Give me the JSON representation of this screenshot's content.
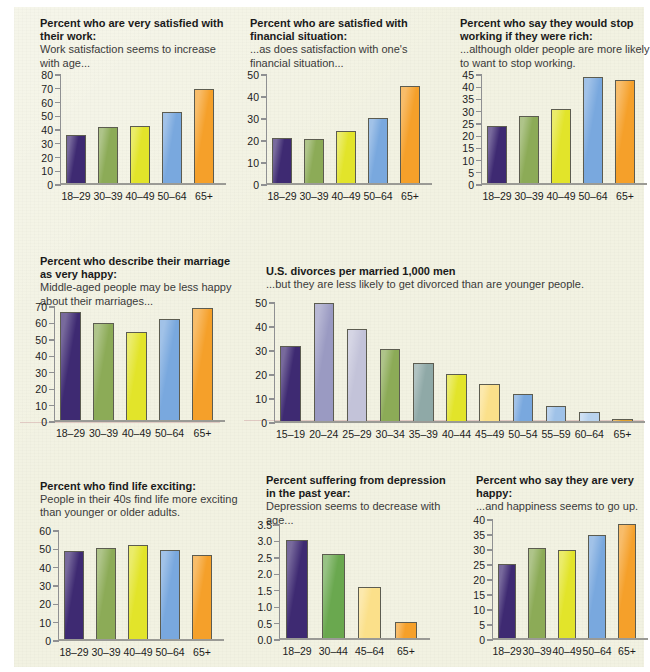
{
  "page": {
    "background_color": "#f2f2e2"
  },
  "palette": {
    "purple": "#3e2a72",
    "olive": "#8cab57",
    "yellow": "#e2e42a",
    "blue": "#79a8de",
    "orange": "#f5a02a",
    "lavender_mid": "#9a9ac2",
    "lavender_light": "#c3c3d9",
    "sage": "#8fa9a7",
    "yellow_pale": "#fbe08a",
    "green": "#6aa84f",
    "gold": "#e0a12e",
    "outline": "#5c5c50",
    "axis": "#8f9092"
  },
  "charts": [
    {
      "id": "satisfied-with-work",
      "chart_data": {
        "type": "bar",
        "title": "Percent who are very satisfied with their work:",
        "subtitle": "Work satisfaction seems to increase with age...",
        "xlabel": "",
        "ylabel": "",
        "categories": [
          "18–29",
          "30–39",
          "40–49",
          "50–64",
          "65+"
        ],
        "values": [
          36,
          41.5,
          42.5,
          53,
          69.5
        ],
        "colors": [
          "#3e2a72",
          "#8cab57",
          "#e2e42a",
          "#79a8de",
          "#f5a02a"
        ],
        "ylim": [
          0,
          80
        ],
        "yticks": [
          0,
          10,
          20,
          30,
          40,
          50,
          60,
          70,
          80
        ],
        "grid": false
      }
    },
    {
      "id": "satisfied-financial-situation",
      "chart_data": {
        "type": "bar",
        "title": "Percent who are satisfied with financial situation:",
        "subtitle": "...as does satisfaction with one's financial situation...",
        "xlabel": "",
        "ylabel": "",
        "categories": [
          "18–29",
          "30–39",
          "40–49",
          "50–64",
          "65+"
        ],
        "values": [
          21,
          20.5,
          24,
          30,
          45
        ],
        "colors": [
          "#3e2a72",
          "#8cab57",
          "#e2e42a",
          "#79a8de",
          "#f5a02a"
        ],
        "ylim": [
          0,
          50
        ],
        "yticks": [
          0,
          10,
          20,
          30,
          40,
          50
        ],
        "grid": false
      }
    },
    {
      "id": "stop-working-if-rich",
      "chart_data": {
        "type": "bar",
        "title": "Percent who say they would stop working if they were rich:",
        "subtitle": "...although older people are more likely to want to stop working.",
        "xlabel": "",
        "ylabel": "",
        "categories": [
          "18–29",
          "30–39",
          "40–49",
          "50–64",
          "65+"
        ],
        "values": [
          24,
          28,
          31,
          44,
          43
        ],
        "colors": [
          "#3e2a72",
          "#8cab57",
          "#e2e42a",
          "#79a8de",
          "#f5a02a"
        ],
        "ylim": [
          0,
          45
        ],
        "yticks": [
          0,
          5,
          10,
          15,
          20,
          25,
          30,
          35,
          40,
          45
        ],
        "grid": false
      }
    },
    {
      "id": "marriage-very-happy",
      "chart_data": {
        "type": "bar",
        "title": "Percent who describe their marriage as very happy:",
        "subtitle": "Middle-aged people may be less happy about their marriages...",
        "xlabel": "",
        "ylabel": "",
        "categories": [
          "18–29",
          "30–39",
          "40–49",
          "50–64",
          "65+"
        ],
        "values": [
          67,
          60,
          54.5,
          62.5,
          69.5
        ],
        "colors": [
          "#3e2a72",
          "#8cab57",
          "#e2e42a",
          "#79a8de",
          "#f5a02a"
        ],
        "ylim": [
          0,
          70
        ],
        "yticks": [
          0,
          10,
          20,
          30,
          40,
          50,
          60,
          70
        ],
        "grid": false
      }
    },
    {
      "id": "us-divorces-per-1000-married-men",
      "chart_data": {
        "type": "bar",
        "title": "U.S. divorces per married 1,000 men",
        "subtitle": "...but they are less likely to get divorced than are younger people.",
        "xlabel": "",
        "ylabel": "",
        "categories": [
          "15–19",
          "20–24",
          "25–29",
          "30–34",
          "35–39",
          "40–44",
          "45–49",
          "50–54",
          "55–59",
          "60–64",
          "65+"
        ],
        "values": [
          32,
          50,
          39,
          30.5,
          24.5,
          20,
          16,
          11.5,
          6.5,
          4,
          1
        ],
        "colors": [
          "#3e2a72",
          "#9a9ac2",
          "#c3c3d9",
          "#8cab57",
          "#8fa9a7",
          "#e2e42a",
          "#fbe08a",
          "#79a8de",
          "#9fc2e8",
          "#b9d3ee",
          "#e0a12e"
        ],
        "ylim": [
          0,
          50
        ],
        "yticks": [
          0,
          10,
          20,
          30,
          40,
          50
        ],
        "grid": false
      }
    },
    {
      "id": "find-life-exciting",
      "chart_data": {
        "type": "bar",
        "title": "Percent who find life exciting:",
        "subtitle": "People in their 40s find life more exciting than younger or older adults.",
        "xlabel": "",
        "ylabel": "",
        "categories": [
          "18–29",
          "30–39",
          "40–49",
          "50–64",
          "65+"
        ],
        "values": [
          49,
          50.8,
          52.5,
          49.7,
          46.8
        ],
        "colors": [
          "#3e2a72",
          "#8cab57",
          "#e2e42a",
          "#79a8de",
          "#f5a02a"
        ],
        "ylim": [
          0,
          60
        ],
        "yticks": [
          0,
          10,
          20,
          30,
          40,
          50,
          60
        ],
        "grid": false
      }
    },
    {
      "id": "depression-past-year",
      "chart_data": {
        "type": "bar",
        "title": "Percent suffering from depression in the past year:",
        "subtitle": "Depression seems to decrease with age...",
        "xlabel": "",
        "ylabel": "",
        "categories": [
          "18–29",
          "30–44",
          "45–64",
          "65+"
        ],
        "values": [
          3.05,
          2.6,
          1.6,
          0.52
        ],
        "colors": [
          "#3e2a72",
          "#6aa84f",
          "#fbe08a",
          "#f5a02a"
        ],
        "ylim": [
          0,
          3.5
        ],
        "yticks": [
          "0.0",
          "0.5",
          "1.0",
          "1.5",
          "2.0",
          "2.5",
          "3.0",
          "3.5"
        ],
        "grid": false
      }
    },
    {
      "id": "very-happy",
      "chart_data": {
        "type": "bar",
        "title": "Percent who say they are very happy:",
        "subtitle": "...and happiness seems to go up.",
        "xlabel": "",
        "ylabel": "",
        "categories": [
          "18–29",
          "30–39",
          "40–49",
          "50–64",
          "65+"
        ],
        "values": [
          25,
          30.5,
          30,
          35,
          38.5
        ],
        "colors": [
          "#3e2a72",
          "#8cab57",
          "#e2e42a",
          "#79a8de",
          "#f5a02a"
        ],
        "ylim": [
          0,
          40
        ],
        "yticks": [
          0,
          5,
          10,
          15,
          20,
          25,
          30,
          35,
          40
        ],
        "grid": false
      }
    }
  ]
}
